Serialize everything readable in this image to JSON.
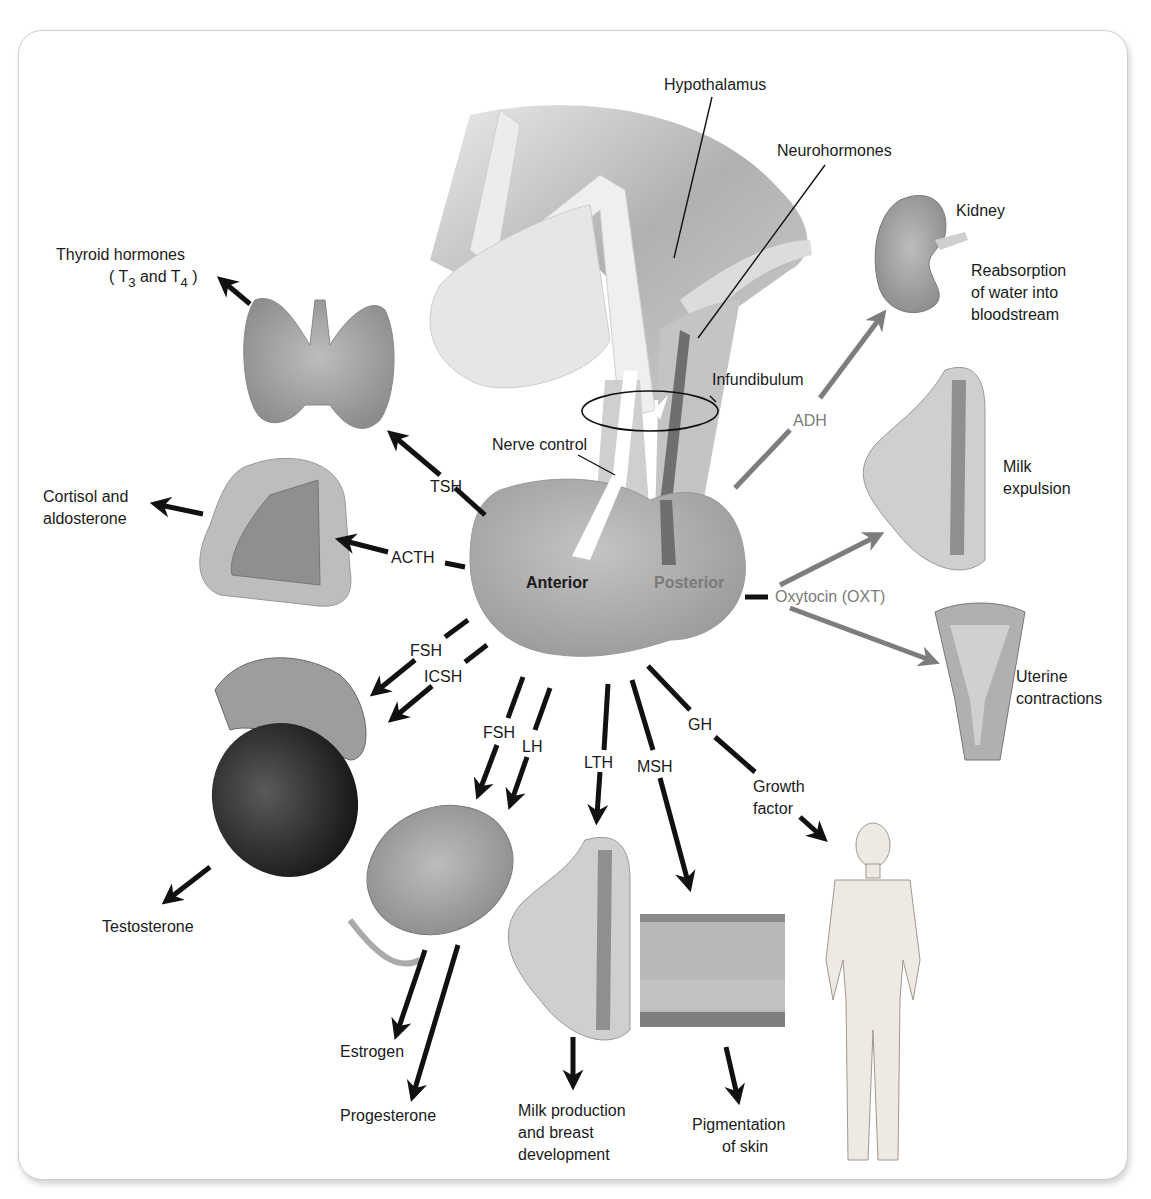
{
  "diagram": {
    "colors": {
      "arrow_anterior": "#111111",
      "arrow_posterior": "#7d7d7d",
      "text_posterior": "#7a7a7a",
      "frame_border": "#cfcfcf",
      "tissue_grey": "#a9a9a9",
      "neurohormone_tract": "#6f6f6f"
    },
    "structures": {
      "hypothalamus": "Hypothalamus",
      "neurohormones": "Neurohormones",
      "infundibulum": "Infundibulum",
      "nerve_control": "Nerve control",
      "anterior": "Anterior",
      "posterior": "Posterior"
    },
    "anterior_hormones": [
      {
        "hormone": "TSH",
        "target": "Thyroid",
        "effect_line1": "Thyroid hormones",
        "effect_line2_pre": "( T",
        "sub3": "3",
        "effect_mid": " and T",
        "sub4": "4",
        "effect_end": " )"
      },
      {
        "hormone": "ACTH",
        "target": "Adrenal cortex",
        "effect_line1": "Cortisol and",
        "effect_line2": "aldosterone"
      },
      {
        "hormone": "FSH",
        "target": "Testis",
        "effect": "Testosterone"
      },
      {
        "hormone": "ICSH",
        "target": "Testis"
      },
      {
        "hormone": "FSH",
        "target": "Ovary",
        "effect": "Estrogen"
      },
      {
        "hormone": "LH",
        "target": "Ovary",
        "effect": "Progesterone"
      },
      {
        "hormone": "LTH",
        "target": "Breast",
        "effect_line1": "Milk production",
        "effect_line2": "and breast",
        "effect_line3": "development"
      },
      {
        "hormone": "MSH",
        "target": "Skin",
        "effect_line1": "Pigmentation",
        "effect_line2": "of skin"
      },
      {
        "hormone": "GH",
        "target": "Body",
        "effect_line1": "Growth",
        "effect_line2": "factor"
      }
    ],
    "posterior_hormones": [
      {
        "hormone": "ADH",
        "target": "Kidney",
        "effect_line1": "Reabsorption",
        "effect_line2": "of water into",
        "effect_line3": "bloodstream"
      },
      {
        "hormone": "Oxytocin (OXT)",
        "target": "Breast",
        "effect_line1": "Milk",
        "effect_line2": "expulsion"
      },
      {
        "hormone": "Oxytocin (OXT)",
        "target": "Uterus",
        "effect_line1": "Uterine",
        "effect_line2": "contractions"
      }
    ],
    "organ_labels": {
      "kidney": "Kidney"
    }
  }
}
